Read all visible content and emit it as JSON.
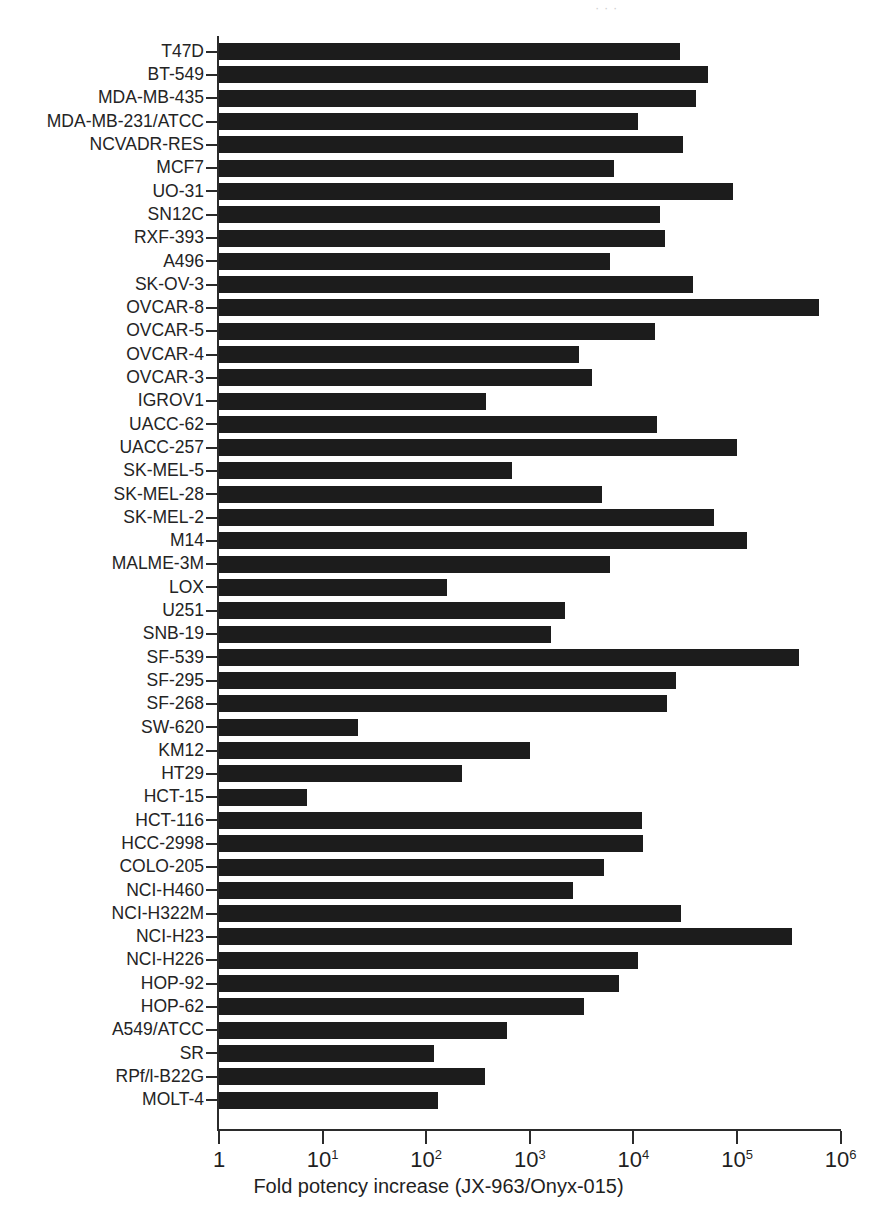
{
  "figure": {
    "clipped_header_text": "· ·   ·",
    "xaxis_title": "Fold potency increase (JX-963/Onyx-015)"
  },
  "chart_data": {
    "type": "bar",
    "orientation": "horizontal",
    "title": "",
    "xlabel": "Fold potency increase (JX-963/Onyx-015)",
    "ylabel": "",
    "xscale": "log",
    "xlim": [
      1,
      1000000
    ],
    "xticks": [
      1,
      10,
      100,
      1000,
      10000,
      100000,
      1000000
    ],
    "xtick_labels": [
      "1",
      "10¹",
      "10²",
      "10³",
      "10⁴",
      "10⁵",
      "10⁶"
    ],
    "grid": false,
    "legend": null,
    "bar_color": "#1c1c1c",
    "categories": [
      "T47D",
      "BT-549",
      "MDA-MB-435",
      "MDA-MB-231/ATCC",
      "NCVADR-RES",
      "MCF7",
      "UO-31",
      "SN12C",
      "RXF-393",
      "A496",
      "SK-OV-3",
      "OVCAR-8",
      "OVCAR-5",
      "OVCAR-4",
      "OVCAR-3",
      "IGROV1",
      "UACC-62",
      "UACC-257",
      "SK-MEL-5",
      "SK-MEL-28",
      "SK-MEL-2",
      "M14",
      "MALME-3M",
      "LOX",
      "U251",
      "SNB-19",
      "SF-539",
      "SF-295",
      "SF-268",
      "SW-620",
      "KM12",
      "HT29",
      "HCT-15",
      "HCT-116",
      "HCC-2998",
      "COLO-205",
      "NCI-H460",
      "NCI-H322M",
      "NCI-H23",
      "NCI-H226",
      "HOP-92",
      "HOP-62",
      "A549/ATCC",
      "SR",
      "RPf/l-B22G",
      "MOLT-4"
    ],
    "values": [
      28000,
      52000,
      40000,
      11000,
      30000,
      6500,
      92000,
      18000,
      20000,
      6000,
      38000,
      620000,
      16000,
      3000,
      4000,
      380,
      17000,
      100000,
      680,
      5000,
      60000,
      125000,
      6000,
      160,
      2200,
      1600,
      400000,
      26000,
      21000,
      22,
      1000,
      220,
      7,
      12000,
      12500,
      5200,
      2600,
      29000,
      340000,
      11000,
      7200,
      3300,
      600,
      120,
      370,
      130
    ]
  }
}
